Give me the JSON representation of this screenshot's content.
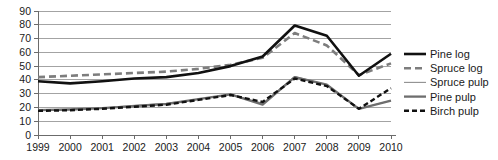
{
  "chart_data": {
    "type": "line",
    "title": "",
    "subtitle": "",
    "xlabel": "",
    "ylabel": "",
    "categories": [
      "1999",
      "2000",
      "2001",
      "2002",
      "2003",
      "2004",
      "2005",
      "2006",
      "2007",
      "2008",
      "2009",
      "2010"
    ],
    "ylim": [
      0,
      90
    ],
    "yticks": [
      0,
      10,
      20,
      30,
      40,
      50,
      60,
      70,
      80,
      90
    ],
    "ytick_labels": [
      "0",
      "10",
      "20",
      "30",
      "40",
      "50",
      "60",
      "70",
      "80",
      "90"
    ],
    "grid": true,
    "legend_position": "right",
    "series": [
      {
        "name": "Pine log",
        "color": "#111111",
        "width": 2.6,
        "dash": "none",
        "values": [
          39,
          37.5,
          39,
          41,
          42,
          45,
          50,
          57,
          79.5,
          72,
          43,
          59
        ]
      },
      {
        "name": "Spruce log",
        "color": "#7d7d7d",
        "width": 2.6,
        "dash": "7,4",
        "values": [
          42,
          43,
          44,
          45,
          46,
          48,
          51,
          56,
          74,
          65,
          43.5,
          52
        ]
      },
      {
        "name": "Spruce pulp",
        "color": "#8f8f8f",
        "width": 1.1,
        "dash": "none",
        "values": [
          18,
          18.5,
          19.5,
          21.5,
          23,
          26,
          29.5,
          23,
          42.5,
          36.5,
          19,
          25
        ]
      },
      {
        "name": "Pine pulp",
        "color": "#6e6e6e",
        "width": 2.3,
        "dash": "none",
        "values": [
          18,
          18.5,
          19.5,
          21,
          22.5,
          26,
          29.5,
          22,
          42,
          36.5,
          19,
          25
        ]
      },
      {
        "name": "Birch pulp",
        "color": "#111111",
        "width": 2.4,
        "dash": "5,3",
        "values": [
          17.5,
          18,
          19,
          20.5,
          22,
          25.5,
          29,
          24,
          41,
          35.5,
          19,
          34
        ]
      }
    ]
  },
  "legend": {
    "items": [
      {
        "label": "Pine log"
      },
      {
        "label": "Spruce log"
      },
      {
        "label": "Spruce pulp"
      },
      {
        "label": "Pine pulp"
      },
      {
        "label": "Birch pulp"
      }
    ]
  }
}
